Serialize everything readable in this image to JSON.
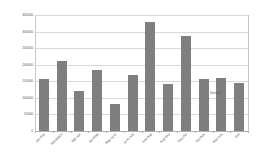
{
  "chart_data": {
    "type": "bar",
    "title": "",
    "xlabel": "",
    "ylabel": "",
    "ylim": [
      0,
      350000
    ],
    "ytick_step": 50000,
    "grid": true,
    "legend_position": "inside-right",
    "bar_color": "#7f7f7f",
    "gridline_color": "#d9d9d9",
    "plot_background": "#ffffff",
    "categories": [
      "Jan-Feb",
      "Feb-March",
      "Mar-Apr",
      "Apr-May",
      "May-June",
      "June-July",
      "July-Aug",
      "Aug-Sep",
      "Sep-Oct",
      "Oct-Nov",
      "Nov-Dec",
      "Dec"
    ],
    "values": [
      158000,
      212000,
      120000,
      185000,
      80000,
      170000,
      330000,
      143000,
      288000,
      158000,
      160000,
      145000
    ],
    "ytick_labels": [
      "0",
      "50000",
      "100000",
      "150000",
      "200000",
      "250000",
      "300000",
      "350000"
    ],
    "ytick_values": [
      0,
      50000,
      100000,
      150000,
      200000,
      250000,
      300000,
      350000
    ],
    "series": [
      {
        "name": "Series1",
        "values": [
          158000,
          212000,
          120000,
          185000,
          80000,
          170000,
          330000,
          143000,
          288000,
          158000,
          160000,
          145000
        ]
      }
    ],
    "legend": [
      "Series1"
    ]
  }
}
